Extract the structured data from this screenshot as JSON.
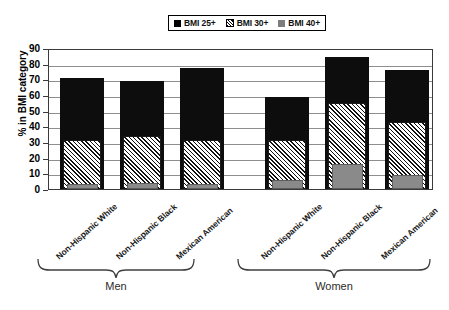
{
  "chart_data": {
    "type": "bar",
    "title": "",
    "xlabel": "",
    "ylabel": "% in BMI category",
    "ylim": [
      0,
      90
    ],
    "ytick_step": 10,
    "yticks": [
      90,
      80,
      70,
      60,
      50,
      40,
      30,
      20,
      10,
      0
    ],
    "grid": true,
    "legend_position": "top-center",
    "bar_style": "overlaid",
    "groups": [
      "Men",
      "Women"
    ],
    "categories": [
      "Non-Hispanic White",
      "Non-Hispanic Black",
      "Mexican American",
      "Non-Hispanic White",
      "Non-Hispanic Black",
      "Mexican American"
    ],
    "series": [
      {
        "name": "BMI 25+",
        "color": "#0d0d0d",
        "pattern": "solid",
        "values": [
          71,
          69,
          77,
          59,
          84,
          76
        ]
      },
      {
        "name": "BMI 30+",
        "color": "#ffffff",
        "pattern": "diagonal-hatch",
        "values": [
          31,
          34,
          31,
          31,
          55,
          43
        ]
      },
      {
        "name": "BMI 40+",
        "color": "#8a8a8a",
        "pattern": "solid",
        "values": [
          3,
          4,
          3,
          6,
          16,
          9
        ]
      }
    ]
  },
  "legend": {
    "items": [
      {
        "label": "BMI 25+",
        "swatch": "black-square-icon"
      },
      {
        "label": "BMI 30+",
        "swatch": "hatched-square-icon"
      },
      {
        "label": "BMI 40+",
        "swatch": "gray-square-icon"
      }
    ]
  },
  "axis": {
    "y_title": "% in BMI category",
    "y_ticks": [
      "90",
      "80",
      "70",
      "60",
      "50",
      "40",
      "30",
      "20",
      "10",
      "0"
    ]
  },
  "x_labels": [
    "Non-Hispanic White",
    "Non-Hispanic Black",
    "Mexican American",
    "Non-Hispanic White",
    "Non-Hispanic Black",
    "Mexican American"
  ],
  "group_labels": [
    "Men",
    "Women"
  ]
}
